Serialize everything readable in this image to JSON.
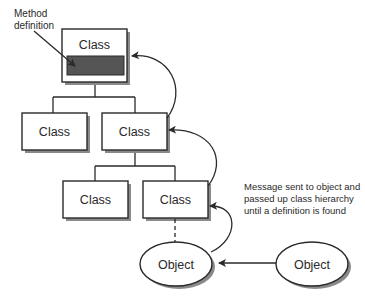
{
  "diagram": {
    "labels": {
      "method_definition": [
        "Method",
        "definition"
      ],
      "message_note": [
        "Message sent to object and",
        "passed up class hierarchy",
        "until a definition is found"
      ]
    },
    "classes": [
      {
        "id": "root",
        "label": "Class",
        "has_method_definition": true
      },
      {
        "id": "level2-left",
        "label": "Class"
      },
      {
        "id": "level2-right",
        "label": "Class"
      },
      {
        "id": "level3-left",
        "label": "Class"
      },
      {
        "id": "level3-right",
        "label": "Class"
      }
    ],
    "objects": [
      {
        "id": "instance",
        "label": "Object"
      },
      {
        "id": "sender",
        "label": "Object"
      }
    ],
    "colors": {
      "stroke": "#2a2a2a",
      "method_fill": "#555555",
      "shadow": "#8a8a8a",
      "background": "#ffffff"
    }
  }
}
